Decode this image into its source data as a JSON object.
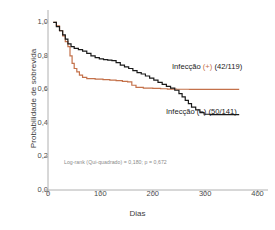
{
  "chart_data": {
    "type": "line",
    "title": "",
    "xlabel": "Dias",
    "ylabel": "Probabilidade de sobrevida",
    "xlim": [
      0,
      420
    ],
    "ylim": [
      0.0,
      1.05
    ],
    "xticks": [
      "0",
      "100",
      "200",
      "300",
      "400"
    ],
    "xtick_values": [
      0,
      100,
      200,
      300,
      400
    ],
    "yticks": [
      "0,0",
      "0,2",
      "0,4",
      "0,6",
      "0,8",
      "1,0"
    ],
    "ytick_values": [
      0.0,
      0.2,
      0.4,
      0.6,
      0.8,
      1.0
    ],
    "grid": false,
    "legend_position": "inline-annotation",
    "annotation": "Log-rank (Qui-quadrado) = 0,180; p = 0,672",
    "series": [
      {
        "name": "Infecção (+) (42/119)",
        "label_main": "Infecção",
        "label_sign": "(+)",
        "label_counts": "(42/119)",
        "color": "#c4714a",
        "step": "post",
        "points": [
          [
            10,
            1.0
          ],
          [
            16,
            0.98
          ],
          [
            22,
            0.95
          ],
          [
            28,
            0.92
          ],
          [
            33,
            0.885
          ],
          [
            38,
            0.855
          ],
          [
            42,
            0.8
          ],
          [
            46,
            0.755
          ],
          [
            50,
            0.725
          ],
          [
            55,
            0.705
          ],
          [
            60,
            0.685
          ],
          [
            66,
            0.672
          ],
          [
            74,
            0.665
          ],
          [
            90,
            0.662
          ],
          [
            105,
            0.658
          ],
          [
            118,
            0.655
          ],
          [
            130,
            0.652
          ],
          [
            142,
            0.648
          ],
          [
            152,
            0.645
          ],
          [
            160,
            0.625
          ],
          [
            168,
            0.612
          ],
          [
            182,
            0.608
          ],
          [
            200,
            0.606
          ],
          [
            215,
            0.604
          ],
          [
            228,
            0.602
          ],
          [
            245,
            0.601
          ],
          [
            270,
            0.6
          ],
          [
            300,
            0.6
          ],
          [
            330,
            0.6
          ],
          [
            365,
            0.6
          ]
        ]
      },
      {
        "name": "Infecção (−) (50/141)",
        "label_main": "Infecção",
        "label_sign": "(−)",
        "label_counts": "(50/141)",
        "color": "#1a1a1a",
        "step": "post",
        "points": [
          [
            10,
            1.0
          ],
          [
            16,
            0.975
          ],
          [
            22,
            0.95
          ],
          [
            28,
            0.925
          ],
          [
            33,
            0.9
          ],
          [
            38,
            0.872
          ],
          [
            44,
            0.855
          ],
          [
            50,
            0.845
          ],
          [
            58,
            0.838
          ],
          [
            66,
            0.828
          ],
          [
            74,
            0.815
          ],
          [
            82,
            0.8
          ],
          [
            90,
            0.79
          ],
          [
            98,
            0.782
          ],
          [
            106,
            0.778
          ],
          [
            114,
            0.775
          ],
          [
            122,
            0.772
          ],
          [
            130,
            0.76
          ],
          [
            138,
            0.745
          ],
          [
            146,
            0.735
          ],
          [
            154,
            0.725
          ],
          [
            162,
            0.712
          ],
          [
            170,
            0.7
          ],
          [
            178,
            0.692
          ],
          [
            186,
            0.68
          ],
          [
            194,
            0.668
          ],
          [
            202,
            0.655
          ],
          [
            210,
            0.642
          ],
          [
            218,
            0.63
          ],
          [
            226,
            0.618
          ],
          [
            234,
            0.608
          ],
          [
            242,
            0.595
          ],
          [
            250,
            0.575
          ],
          [
            256,
            0.555
          ],
          [
            262,
            0.535
          ],
          [
            268,
            0.515
          ],
          [
            274,
            0.495
          ],
          [
            282,
            0.478
          ],
          [
            290,
            0.462
          ],
          [
            298,
            0.452
          ],
          [
            310,
            0.45
          ],
          [
            330,
            0.45
          ],
          [
            350,
            0.45
          ],
          [
            365,
            0.45
          ]
        ]
      }
    ]
  },
  "colors": {
    "infection_positive": "#c4714a",
    "infection_negative": "#1a1a1a",
    "axis": "#b0b0b0",
    "tick_text": "#4a4a4a",
    "annotation_text": "#8a8a8a"
  }
}
